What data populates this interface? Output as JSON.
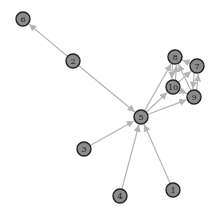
{
  "diagram": {
    "type": "directed-graph",
    "node_fill": "#8c8c8c",
    "node_stroke": "#222222",
    "edge_color": "#b4b4b4",
    "node_radius": 7,
    "nodes": [
      {
        "id": "1",
        "label": "1",
        "x": 173,
        "y": 190
      },
      {
        "id": "2",
        "label": "2",
        "x": 73,
        "y": 61
      },
      {
        "id": "3",
        "label": "3",
        "x": 84,
        "y": 149
      },
      {
        "id": "4",
        "label": "4",
        "x": 120,
        "y": 196
      },
      {
        "id": "5",
        "label": "5",
        "x": 141,
        "y": 117
      },
      {
        "id": "6",
        "label": "6",
        "x": 23,
        "y": 19
      },
      {
        "id": "7",
        "label": "7",
        "x": 197,
        "y": 66
      },
      {
        "id": "8",
        "label": "8",
        "x": 175,
        "y": 57
      },
      {
        "id": "9",
        "label": "9",
        "x": 194,
        "y": 97
      },
      {
        "id": "10",
        "label": "10",
        "x": 173,
        "y": 87
      }
    ],
    "edges": [
      {
        "from": "2",
        "to": "6"
      },
      {
        "from": "2",
        "to": "5"
      },
      {
        "from": "3",
        "to": "5"
      },
      {
        "from": "4",
        "to": "5"
      },
      {
        "from": "1",
        "to": "5"
      },
      {
        "from": "5",
        "to": "8"
      },
      {
        "from": "5",
        "to": "10"
      },
      {
        "from": "5",
        "to": "9"
      },
      {
        "from": "8",
        "to": "10"
      },
      {
        "from": "10",
        "to": "8"
      },
      {
        "from": "7",
        "to": "8"
      },
      {
        "from": "7",
        "to": "9"
      },
      {
        "from": "9",
        "to": "7"
      },
      {
        "from": "10",
        "to": "9"
      },
      {
        "from": "10",
        "to": "7"
      },
      {
        "from": "9",
        "to": "8"
      }
    ]
  }
}
